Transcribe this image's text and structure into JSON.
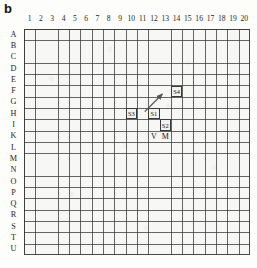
{
  "figure": {
    "panel_label": "b",
    "grid": {
      "columns": [
        "1",
        "2",
        "3",
        "4",
        "5",
        "6",
        "7",
        "8",
        "9",
        "10",
        "11",
        "12",
        "13",
        "14",
        "15",
        "16",
        "17",
        "18",
        "19",
        "20"
      ],
      "rows": [
        "A",
        "B",
        "C",
        "D",
        "E",
        "F",
        "G",
        "H",
        "I",
        "K",
        "L",
        "M",
        "N",
        "O",
        "P",
        "Q",
        "R",
        "S",
        "T",
        "U"
      ],
      "cols_count": 20,
      "rows_count": 20,
      "cell_size_px": 11.3,
      "line_color": "#3c3c3c",
      "fill_color": "#f7f7f5"
    },
    "markers": [
      {
        "id": "S4",
        "label": "S4",
        "col": 14,
        "row": "F",
        "style": "boxed"
      },
      {
        "id": "S3",
        "label": "S3",
        "col": 10,
        "row": "H",
        "style": "boxed"
      },
      {
        "id": "S1",
        "label": "S1",
        "col": 12,
        "row": "H",
        "style": "boxed"
      },
      {
        "id": "S2",
        "label": "S2",
        "col": 13,
        "row": "I",
        "style": "boxed"
      },
      {
        "id": "V",
        "label": "V",
        "col": 12,
        "row": "K",
        "style": "plain"
      },
      {
        "id": "M",
        "label": "M",
        "col": 13,
        "row": "K",
        "style": "plain"
      }
    ],
    "arrow": {
      "from_col": 11,
      "from_row": "H",
      "to_col": 13,
      "to_row": "F",
      "color": "#555555",
      "direction": "up-right"
    }
  }
}
